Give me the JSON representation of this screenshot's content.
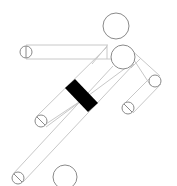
{
  "figure": {
    "colors": {
      "background": "#ffffff",
      "limb_line": "#c8c8c8",
      "joint_line": "#8a8a8a",
      "band": "#000000"
    },
    "joints": [
      {
        "name": "head",
        "cx": 116,
        "cy": 26,
        "r": 13
      },
      {
        "name": "shoulder",
        "cx": 123,
        "cy": 57,
        "r": 12
      },
      {
        "name": "left-hand",
        "cx": 26,
        "cy": 52,
        "r": 6
      },
      {
        "name": "right-elbow",
        "cx": 155,
        "cy": 81,
        "r": 6
      },
      {
        "name": "right-hand",
        "cx": 128,
        "cy": 108,
        "r": 6
      },
      {
        "name": "knee",
        "cx": 41,
        "cy": 121,
        "r": 6
      },
      {
        "name": "foot",
        "cx": 18,
        "cy": 178,
        "r": 6
      },
      {
        "name": "ball",
        "cx": 65,
        "cy": 177,
        "r": 12
      }
    ],
    "band": {
      "points": "65,88 75,79 98,103 88,112"
    }
  }
}
